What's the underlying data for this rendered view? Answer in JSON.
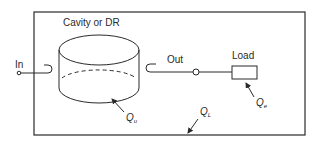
{
  "diagram": {
    "title": "Cavity or DR",
    "ports": {
      "input": "In",
      "output": "Out"
    },
    "load": "Load",
    "quality_factors": {
      "unloaded": {
        "symbol": "Q",
        "subscript": "u"
      },
      "external": {
        "symbol": "Q",
        "subscript": "e"
      },
      "loaded": {
        "symbol": "Q",
        "subscript": "L"
      }
    },
    "colors": {
      "line": "#2a2a2a",
      "background": "#ffffff"
    }
  }
}
